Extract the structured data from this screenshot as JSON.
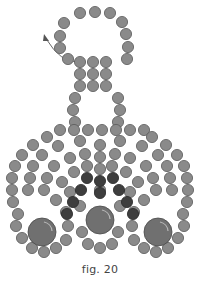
{
  "caption": "fig. 20",
  "colors": {
    "bead_fill": "#8a8a8a",
    "bead_stroke": "#5a5a5a",
    "dark_bead_fill": "#3e3e3e",
    "dark_bead_stroke": "#2a2a2a",
    "large_bead_fill": "#707070",
    "large_bead_stroke": "#4a4a4a",
    "arrow": "#555555"
  },
  "bead_radius": 5.6,
  "arrow": {
    "path": "M78,62 Q60,62 47,40",
    "head": "M44,34 L49,41 L43,41 Z"
  },
  "loop_beads": [
    [
      80,
      13
    ],
    [
      95,
      12
    ],
    [
      110,
      13
    ],
    [
      122,
      22
    ],
    [
      126,
      34
    ],
    [
      128,
      47
    ],
    [
      127,
      59
    ],
    [
      64,
      23
    ],
    [
      60,
      36
    ],
    [
      60,
      48
    ],
    [
      68,
      59
    ]
  ],
  "stem_beads": [
    [
      80,
      62
    ],
    [
      93,
      62
    ],
    [
      106,
      62
    ],
    [
      80,
      74
    ],
    [
      93,
      74
    ],
    [
      106,
      74
    ],
    [
      80,
      86
    ],
    [
      93,
      86
    ],
    [
      106,
      86
    ],
    [
      75,
      98
    ],
    [
      118,
      98
    ],
    [
      73,
      110
    ],
    [
      120,
      110
    ],
    [
      75,
      122
    ],
    [
      118,
      122
    ]
  ],
  "body_light_beads": [
    [
      60,
      130
    ],
    [
      74,
      130
    ],
    [
      88,
      130
    ],
    [
      102,
      130
    ],
    [
      116,
      130
    ],
    [
      130,
      130
    ],
    [
      144,
      130
    ],
    [
      47,
      137
    ],
    [
      33,
      145
    ],
    [
      22,
      155
    ],
    [
      15,
      166
    ],
    [
      12,
      178
    ],
    [
      12,
      190
    ],
    [
      13,
      202
    ],
    [
      18,
      214
    ],
    [
      152,
      137
    ],
    [
      166,
      145
    ],
    [
      177,
      155
    ],
    [
      184,
      166
    ],
    [
      187,
      178
    ],
    [
      188,
      190
    ],
    [
      187,
      202
    ],
    [
      183,
      214
    ],
    [
      80,
      141
    ],
    [
      58,
      146
    ],
    [
      42,
      155
    ],
    [
      33,
      166
    ],
    [
      30,
      178
    ],
    [
      28,
      190
    ],
    [
      120,
      141
    ],
    [
      142,
      146
    ],
    [
      158,
      155
    ],
    [
      167,
      166
    ],
    [
      170,
      178
    ],
    [
      172,
      190
    ],
    [
      100,
      145
    ],
    [
      100,
      157
    ],
    [
      100,
      169
    ],
    [
      85,
      154
    ],
    [
      70,
      158
    ],
    [
      54,
      166
    ],
    [
      47,
      178
    ],
    [
      44,
      190
    ],
    [
      115,
      154
    ],
    [
      130,
      158
    ],
    [
      146,
      166
    ],
    [
      153,
      178
    ],
    [
      156,
      190
    ],
    [
      87,
      166
    ],
    [
      74,
      172
    ],
    [
      62,
      182
    ],
    [
      112,
      166
    ],
    [
      126,
      172
    ],
    [
      138,
      182
    ],
    [
      100,
      190
    ],
    [
      70,
      192
    ],
    [
      130,
      192
    ],
    [
      56,
      200
    ],
    [
      144,
      200
    ],
    [
      16,
      226
    ],
    [
      22,
      238
    ],
    [
      32,
      248
    ],
    [
      44,
      252
    ],
    [
      56,
      248
    ],
    [
      66,
      240
    ],
    [
      68,
      226
    ],
    [
      66,
      212
    ],
    [
      184,
      226
    ],
    [
      178,
      238
    ],
    [
      168,
      248
    ],
    [
      156,
      252
    ],
    [
      144,
      248
    ],
    [
      134,
      240
    ],
    [
      132,
      226
    ],
    [
      134,
      212
    ],
    [
      82,
      232
    ],
    [
      88,
      244
    ],
    [
      100,
      248
    ],
    [
      112,
      244
    ],
    [
      118,
      232
    ],
    [
      80,
      206
    ],
    [
      120,
      206
    ]
  ],
  "body_dark_beads": [
    [
      100,
      181
    ],
    [
      100,
      193
    ],
    [
      87,
      178
    ],
    [
      81,
      190
    ],
    [
      113,
      178
    ],
    [
      119,
      190
    ],
    [
      73,
      202
    ],
    [
      127,
      202
    ],
    [
      67,
      214
    ],
    [
      133,
      214
    ]
  ],
  "large_beads": [
    [
      42,
      232,
      14
    ],
    [
      100,
      220,
      14
    ],
    [
      158,
      232,
      14
    ]
  ]
}
